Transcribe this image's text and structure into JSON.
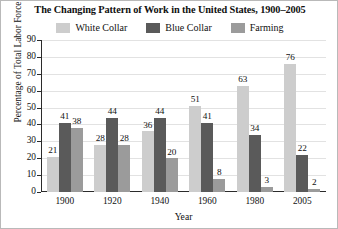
{
  "chart_data": {
    "type": "bar",
    "title": "The Changing Pattern of Work in the United States, 1900–2005",
    "xlabel": "Year",
    "ylabel": "Percentage of Total Labor Force",
    "categories": [
      "1900",
      "1920",
      "1940",
      "1960",
      "1980",
      "2005"
    ],
    "series": [
      {
        "name": "White Collar",
        "color": "#cdcdcd",
        "values": [
          21,
          28,
          36,
          51,
          63,
          76
        ]
      },
      {
        "name": "Blue Collar",
        "color": "#5a5a5a",
        "values": [
          41,
          44,
          44,
          41,
          34,
          22
        ]
      },
      {
        "name": "Farming",
        "color": "#9b9b9b",
        "values": [
          38,
          28,
          20,
          8,
          3,
          2
        ]
      }
    ],
    "ylim": [
      0,
      90
    ],
    "yticks": [
      0,
      10,
      20,
      30,
      40,
      50,
      60,
      70,
      80,
      90
    ],
    "ytick_labels": [
      "0",
      "10",
      "20",
      "30",
      "40",
      "50",
      "60",
      "70",
      "80",
      "90"
    ],
    "grid": true,
    "legend_position": "top"
  },
  "legend": {
    "items": [
      {
        "label": "White Collar",
        "color": "#cdcdcd"
      },
      {
        "label": "Blue Collar",
        "color": "#5a5a5a"
      },
      {
        "label": "Farming",
        "color": "#9b9b9b"
      }
    ]
  }
}
